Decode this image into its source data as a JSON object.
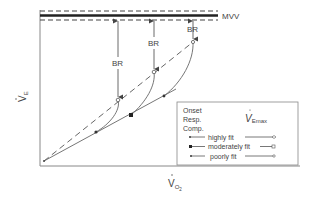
{
  "figure": {
    "type": "physiology-diagram",
    "y_axis_label": "V̇E",
    "y_axis_label_main": "V",
    "y_axis_label_sub": "E",
    "x_axis_label_main": "V",
    "x_axis_label_sub": "O",
    "x_axis_label_subsub": "2",
    "mvv_label": "MVV",
    "br_label": "BR",
    "br_labels": [
      "BR",
      "BR",
      "BR"
    ],
    "legend": {
      "onset_lines": [
        "Onset",
        "Resp.",
        "Comp."
      ],
      "vemax_main": "V",
      "vemax_sub": "Emax",
      "entries": [
        {
          "label": "highly fit",
          "start_marker": "arrow-dot",
          "end_marker": "open-diamond"
        },
        {
          "label": "moderately fit",
          "start_marker": "filled-square",
          "end_marker": "open-square"
        },
        {
          "label": "poorly fit",
          "start_marker": "filled-circle",
          "end_marker": "open-circle"
        }
      ]
    },
    "colors": {
      "line": "#555555",
      "axis": "#777777",
      "text": "#444444",
      "background": "#ffffff"
    }
  }
}
